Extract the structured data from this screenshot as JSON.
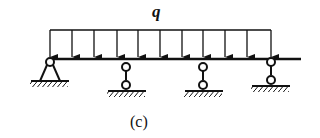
{
  "diagram": {
    "load_label": "q",
    "caption": "(c)",
    "load_type": "uniformly distributed load",
    "beam": "continuous beam",
    "supports": [
      {
        "type": "pin",
        "x": 50
      },
      {
        "type": "link-roller",
        "x": 126
      },
      {
        "type": "link-roller",
        "x": 203
      },
      {
        "type": "link-roller",
        "x": 271
      }
    ],
    "arrow_x": [
      50,
      72,
      94,
      117,
      138,
      160,
      182,
      203,
      225,
      247,
      271
    ],
    "colors": {
      "line": "#111111",
      "background": "#ffffff"
    }
  }
}
